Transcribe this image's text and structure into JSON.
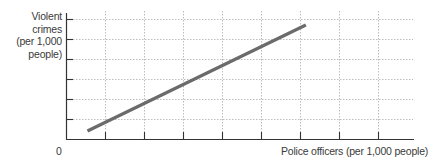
{
  "chart_data": {
    "type": "line",
    "title": "",
    "xlabel": "Police officers (per 1,000 people)",
    "ylabel": "Violent crimes (per 1,000 people)",
    "ylabel_lines": [
      "Violent",
      "crimes",
      "(per 1,000",
      "people)"
    ],
    "origin_label": "0",
    "x_tick_count": 9,
    "y_tick_count": 6,
    "grid": true,
    "grid_style": "dotted",
    "xlim": [
      0,
      9
    ],
    "ylim": [
      0,
      6.3
    ],
    "series": [
      {
        "name": "Relationship",
        "x": [
          0.55,
          6.15
        ],
        "y": [
          0.4,
          5.7
        ],
        "color": "#6b6b6b"
      }
    ],
    "tick_labels_shown": false,
    "note": "Conceptual positive linear relationship; axes have no numeric tick labels"
  },
  "style": {
    "axis_color": "#333333",
    "grid_color": "#bdbdbd",
    "line_color": "#6b6b6b"
  }
}
